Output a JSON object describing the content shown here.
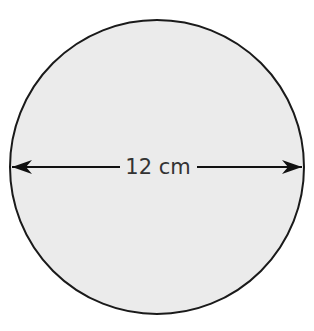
{
  "diagram": {
    "shape": "circle",
    "fill_color": "#ebebeb",
    "stroke_color": "#1a1a1a",
    "dimension_label": "12 cm",
    "dimension_type": "diameter",
    "arrow_color": "#111111"
  }
}
